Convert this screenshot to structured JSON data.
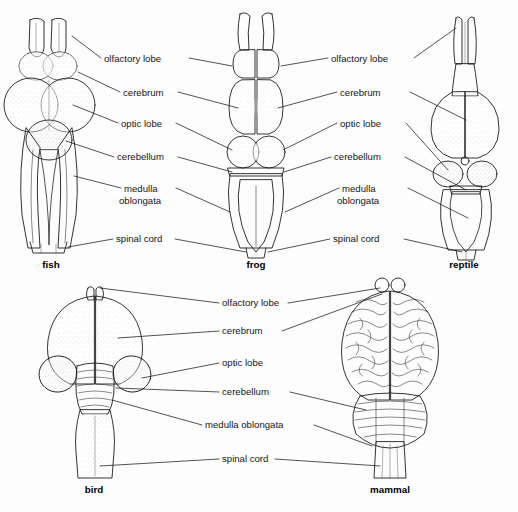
{
  "figure": {
    "background_color": "#fdfdfd",
    "ink_color": "#1a1a1a",
    "label_font_size_px": 9.6
  },
  "structures": [
    "olfactory lobe",
    "cerebrum",
    "optic lobe",
    "cerebellum",
    "medulla oblongata",
    "spinal cord"
  ],
  "top_row": {
    "left_labels": [
      {
        "text": "olfactory lobe",
        "x": 104,
        "y": 62
      },
      {
        "text": "cerebrum",
        "x": 123,
        "y": 96
      },
      {
        "text": "optic lobe",
        "x": 121,
        "y": 127
      },
      {
        "text": "cerebellum",
        "x": 117,
        "y": 160
      },
      {
        "text": "medulla",
        "x": 124,
        "y": 192
      },
      {
        "text": "oblongata",
        "x": 119,
        "y": 204
      },
      {
        "text": "spinal cord",
        "x": 116,
        "y": 242
      }
    ],
    "right_labels": [
      {
        "text": "olfactory lobe",
        "x": 331,
        "y": 62
      },
      {
        "text": "cerebrum",
        "x": 340,
        "y": 96
      },
      {
        "text": "optic lobe",
        "x": 340,
        "y": 127
      },
      {
        "text": "cerebellum",
        "x": 334,
        "y": 160
      },
      {
        "text": "medulla",
        "x": 342,
        "y": 192
      },
      {
        "text": "oblongata",
        "x": 337,
        "y": 204
      },
      {
        "text": "spinal cord",
        "x": 333,
        "y": 242
      }
    ],
    "specimens": [
      {
        "name": "fish",
        "caption": "fish",
        "caption_x": 51,
        "caption_y": 268
      },
      {
        "name": "frog",
        "caption": "frog",
        "caption_x": 256,
        "caption_y": 268
      },
      {
        "name": "reptile",
        "caption": "reptile",
        "caption_x": 464,
        "caption_y": 268
      }
    ]
  },
  "bottom_row": {
    "center_labels": [
      {
        "text": "olfactory lobe",
        "x": 222,
        "y": 306
      },
      {
        "text": "cerebrum",
        "x": 222,
        "y": 334
      },
      {
        "text": "optic lobe",
        "x": 222,
        "y": 366
      },
      {
        "text": "cerebellum",
        "x": 222,
        "y": 395
      },
      {
        "text": "medulla oblongata",
        "x": 205,
        "y": 428
      },
      {
        "text": "spinal cord",
        "x": 222,
        "y": 462
      }
    ],
    "specimens": [
      {
        "name": "bird",
        "caption": "bird",
        "caption_x": 94,
        "caption_y": 493
      },
      {
        "name": "mammal",
        "caption": "mammal",
        "caption_x": 390,
        "caption_y": 493
      }
    ]
  }
}
